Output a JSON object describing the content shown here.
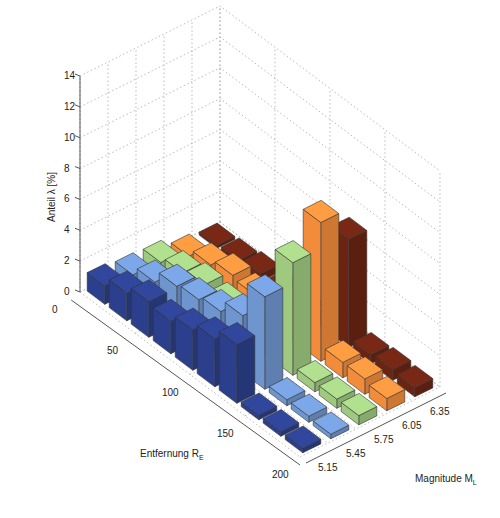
{
  "chart_data": {
    "type": "bar3d",
    "title": "",
    "zlabel": "Anteil λ [%]",
    "xlabel": "Entfernung R",
    "xlabel_sub": "E",
    "ylabel": "Magnitude M",
    "ylabel_sub": "L",
    "z_ticks": [
      "0",
      "2",
      "4",
      "6",
      "8",
      "10",
      "12",
      "14"
    ],
    "zlim": [
      0,
      14
    ],
    "distance_ticks": [
      "0",
      "50",
      "100",
      "150",
      "200"
    ],
    "magnitude_ticks": [
      "5.15",
      "5.45",
      "5.75",
      "6.05",
      "6.35"
    ],
    "grid": true,
    "distance_bins": [
      10,
      30,
      50,
      70,
      90,
      110,
      130,
      150,
      170,
      190
    ],
    "series": [
      {
        "name": "5.15",
        "color": "#2b3f8c",
        "values": [
          1.2,
          1.8,
          2.3,
          2.1,
          2.6,
          3.1,
          3.8,
          0.3,
          0.3,
          0.3
        ]
      },
      {
        "name": "5.45",
        "color": "#6f95cf",
        "values": [
          1.0,
          1.6,
          2.4,
          2.6,
          2.9,
          3.7,
          6.0,
          0.4,
          0.4,
          0.3
        ]
      },
      {
        "name": "5.75",
        "color": "#9ec97f",
        "values": [
          0.9,
          1.3,
          1.6,
          1.4,
          1.6,
          2.7,
          7.3,
          0.6,
          0.6,
          0.6
        ]
      },
      {
        "name": "6.05",
        "color": "#f28c3b",
        "values": [
          0.4,
          0.9,
          1.3,
          1.1,
          1.5,
          2.5,
          9.0,
          1.0,
          1.0,
          0.8
        ]
      },
      {
        "name": "6.35",
        "color": "#6b2412",
        "values": [
          0.2,
          0.3,
          0.5,
          0.3,
          0.2,
          0.2,
          7.0,
          0.6,
          0.7,
          0.6
        ]
      }
    ]
  }
}
